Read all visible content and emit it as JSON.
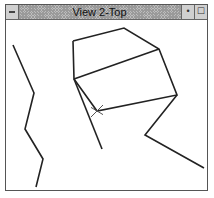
{
  "window": {
    "title": "View 2-Top",
    "system_menu_icon": "dash-icon",
    "minimize_icon": "down-arrow-icon",
    "maximize_icon": "square-icon",
    "minimize_glyph": "•",
    "maximize_glyph": "☐"
  },
  "viewport": {
    "line_color": "#222222",
    "background": "#ffffff",
    "polylines": [
      {
        "name": "left-zigzag",
        "points": "12,44 33,92 24,128 42,158 35,186"
      },
      {
        "name": "upper-polygon",
        "points": "72,40 123,27 158,48 176,94 96,110 73,78 72,40"
      },
      {
        "name": "middle-edge",
        "points": "73,78 158,48"
      },
      {
        "name": "lower-edge",
        "points": "73,78 101,148"
      },
      {
        "name": "right-zigzag",
        "points": "176,94 144,134 203,167"
      }
    ],
    "marker": {
      "x": 96,
      "y": 110,
      "size": 12
    }
  }
}
